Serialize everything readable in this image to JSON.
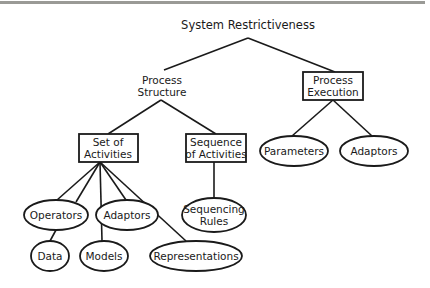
{
  "diagram": {
    "type": "tree",
    "root": {
      "label": "System Restrictiveness",
      "children": [
        "process_structure",
        "process_execution"
      ]
    },
    "nodes": {
      "process_structure": {
        "line1": "Process",
        "line2": "Structure",
        "shape": "none"
      },
      "process_execution": {
        "line1": "Process",
        "line2": "Execution",
        "shape": "box"
      },
      "set_of_activities": {
        "line1": "Set of",
        "line2": "Activities",
        "shape": "box"
      },
      "sequence_of_activities": {
        "line1": "Sequence",
        "line2": "of Activities",
        "shape": "box"
      },
      "parameters": {
        "label": "Parameters",
        "shape": "ellipse"
      },
      "adaptors_exec": {
        "label": "Adaptors",
        "shape": "ellipse"
      },
      "operators": {
        "label": "Operators",
        "shape": "ellipse"
      },
      "adaptors_set": {
        "label": "Adaptors",
        "shape": "ellipse"
      },
      "sequencing_rules": {
        "line1": "Sequencing",
        "line2": "Rules",
        "shape": "ellipse"
      },
      "data": {
        "label": "Data",
        "shape": "ellipse"
      },
      "models": {
        "label": "Models",
        "shape": "ellipse"
      },
      "representations": {
        "label": "Representations",
        "shape": "ellipse"
      }
    },
    "edges": [
      [
        "root",
        "process_structure"
      ],
      [
        "root",
        "process_execution"
      ],
      [
        "process_structure",
        "set_of_activities"
      ],
      [
        "process_structure",
        "sequence_of_activities"
      ],
      [
        "process_execution",
        "parameters"
      ],
      [
        "process_execution",
        "adaptors_exec"
      ],
      [
        "set_of_activities",
        "operators"
      ],
      [
        "set_of_activities",
        "adaptors_set"
      ],
      [
        "set_of_activities",
        "data"
      ],
      [
        "set_of_activities",
        "models"
      ],
      [
        "set_of_activities",
        "representations"
      ],
      [
        "sequence_of_activities",
        "sequencing_rules"
      ]
    ]
  },
  "colors": {
    "stroke": "#1a1a1a",
    "topbar": "#9a9a96",
    "background": "#ffffff"
  }
}
